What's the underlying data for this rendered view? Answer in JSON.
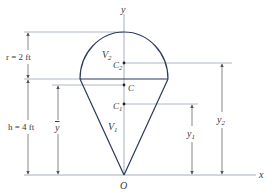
{
  "figure": {
    "axes": {
      "x_label": "x",
      "y_label": "y",
      "origin_label": "O"
    },
    "shapes": {
      "hemisphere_label": "V",
      "hemisphere_sub": "2",
      "cone_label": "V",
      "cone_sub": "1"
    },
    "centroids": {
      "composite": "C",
      "hemisphere": "C",
      "hemisphere_sub": "2",
      "cone": "C",
      "cone_sub": "1"
    },
    "dimensions": {
      "radius": "r = 2 ft",
      "height": "h = 4 ft",
      "ybar": "y",
      "y1": "y",
      "y1_sub": "1",
      "y2": "y",
      "y2_sub": "2"
    },
    "colors": {
      "shape_stroke": "#2e3a5c",
      "axis_line": "#9aa3b5",
      "dim_line": "#6f6f6f",
      "text": "#3a3a3a"
    }
  }
}
